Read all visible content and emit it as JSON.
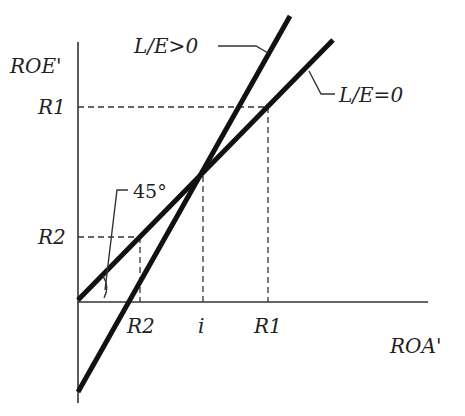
{
  "diagram": {
    "type": "line-diagram",
    "axes": {
      "y_label": "ROE'",
      "x_label": "ROA'"
    },
    "y_ticks": [
      {
        "label": "R1",
        "y_px": 107
      },
      {
        "label": "R2",
        "y_px": 237
      }
    ],
    "x_ticks": [
      {
        "label": "R2",
        "x_px": 140
      },
      {
        "label": "i",
        "x_px": 203
      },
      {
        "label": "R1",
        "x_px": 268
      }
    ],
    "lines": [
      {
        "name": "L/E>0",
        "label": "L/E>0",
        "description": "steep line through intersection point (i, i), negative ROE' intercept"
      },
      {
        "name": "L/E=0",
        "label": "L/E=0",
        "description": "45-degree line through origin"
      }
    ],
    "angle_annotation": "45°",
    "colors": {
      "line": "#111111",
      "axis": "#333333",
      "text": "#222222",
      "background": "#ffffff"
    }
  },
  "labels": {
    "roe": "ROE'",
    "roa": "ROA'",
    "y_r1": "R1",
    "y_r2": "R2",
    "x_r2": "R2",
    "x_i": "i",
    "x_r1": "R1",
    "le_pos": "L/E>0",
    "le_zero": "L/E=0",
    "angle": "45°"
  }
}
